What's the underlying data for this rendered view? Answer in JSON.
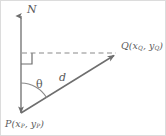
{
  "figure": {
    "type": "geometry-diagram",
    "background_color": "#ffffff",
    "line_color": "#6e6e6e",
    "text_color": "#5b5b5b",
    "border_color": "#d8d8d8",
    "width": 166,
    "height": 136
  },
  "labels": {
    "north": "N",
    "theta": "θ",
    "distance": "d",
    "point_q": {
      "name": "Q",
      "open_paren": "(",
      "x_var": "x",
      "x_sub": "Q",
      "comma": ", ",
      "y_var": "y",
      "y_sub": "Q",
      "close_paren": ")",
      "full": "Q(xQ, yQ)"
    },
    "point_p": {
      "name": "P",
      "open_paren": "(",
      "x_var": "x",
      "x_sub": "P",
      "comma": ", ",
      "y_var": "y",
      "y_sub": "P",
      "close_paren": ")",
      "full": "P(xP, yP)"
    }
  },
  "geometry": {
    "point_p": {
      "x": 21,
      "y": 113
    },
    "point_q": {
      "x": 118,
      "y": 53
    },
    "axis_top": {
      "x": 21,
      "y": 14
    },
    "dashed_line_start": {
      "x": 21,
      "y": 53
    },
    "right_angle_size": 11,
    "arc_radius": 30
  }
}
